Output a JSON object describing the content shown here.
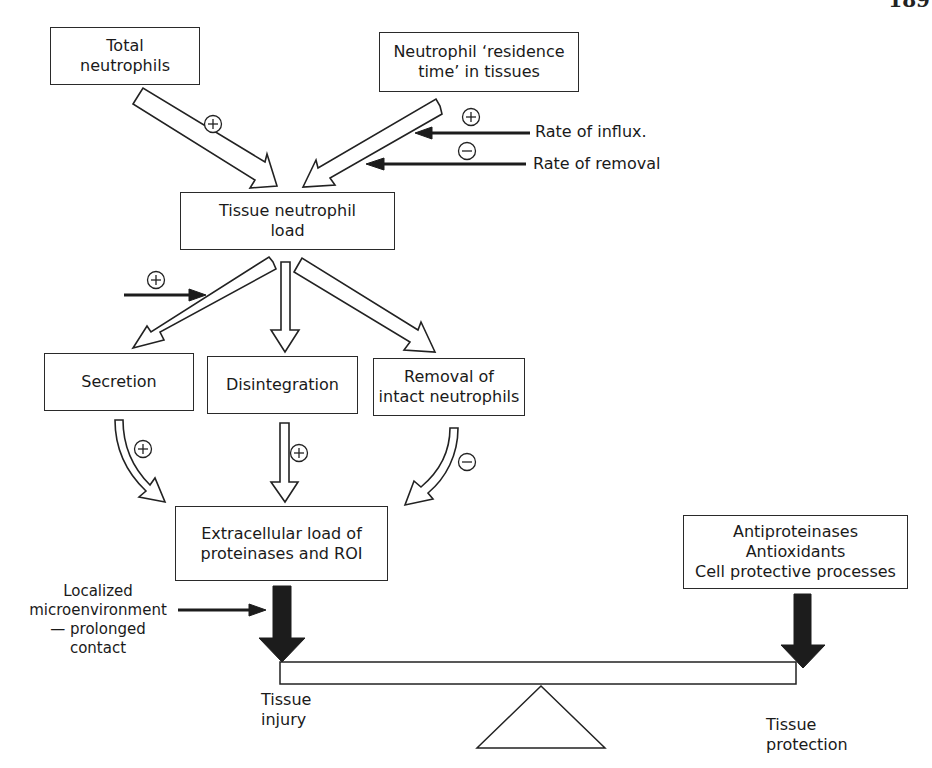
{
  "page": {
    "number": "189"
  },
  "boxes": {
    "total_neutrophils": [
      "Total",
      "neutrophils"
    ],
    "residence_time": [
      "Neutrophil ‘residence",
      "time’ in tissues"
    ],
    "tissue_load": [
      "Tissue neutrophil",
      "load"
    ],
    "secretion": [
      "Secretion"
    ],
    "disintegration": [
      "Disintegration"
    ],
    "removal": [
      "Removal of",
      "intact neutrophils"
    ],
    "extracellular": [
      "Extracellular load of",
      "proteinases and ROI"
    ],
    "protective": [
      "Antiproteinases",
      "Antioxidants",
      "Cell protective processes"
    ]
  },
  "labels": {
    "rate_influx": "Rate of influx.",
    "rate_removal": "Rate of removal",
    "microenvironment": [
      "Localized",
      "microenvironment",
      "— prolonged",
      "contact"
    ],
    "tissue_injury": [
      "Tissue",
      "injury"
    ],
    "tissue_protection": [
      "Tissue",
      "protection"
    ]
  },
  "signs": {
    "plus": "+",
    "minus": "−"
  }
}
